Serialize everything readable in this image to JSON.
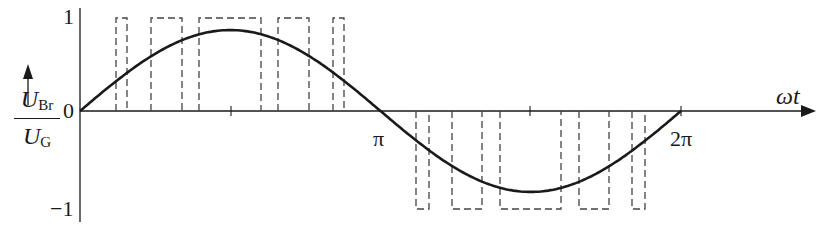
{
  "chart_data": {
    "type": "line",
    "title": "",
    "xlabel": "ωt",
    "ylabel": "U_Br / U_G",
    "ylabel_parts": {
      "num_main": "U",
      "num_sub": "Br",
      "den_main": "U",
      "den_sub": "G"
    },
    "xtick_labels": [
      "π",
      "2π"
    ],
    "ytick_labels": [
      "1",
      "0",
      "−1"
    ],
    "ylim": [
      -1,
      1
    ],
    "xlim": [
      0,
      6.2832
    ],
    "grid": false,
    "legend": null,
    "series": [
      {
        "name": "fundamental (sine)",
        "style": "solid",
        "amplitude": 0.87,
        "description": "0.87·sin(ωt) over one period 0..2π"
      },
      {
        "name": "PWM pulses",
        "style": "dashed",
        "description": "Rectangular pulses of height +1 in first half-period and −1 in second half-period",
        "positive_pulses_rad": [
          [
            0.22,
            0.45
          ],
          [
            0.73,
            1.38
          ],
          [
            1.72,
            3.02
          ],
          [
            4.04,
            4.67
          ],
          [
            5.15,
            5.38
          ]
        ],
        "positive_pulses_px": [
          [
            116,
            127
          ],
          [
            151,
            182
          ],
          [
            199,
            261
          ],
          [
            278,
            309
          ],
          [
            333,
            344
          ]
        ],
        "negative_pulses_px": [
          [
            416,
            429
          ],
          [
            452,
            482
          ],
          [
            500,
            561
          ],
          [
            579,
            609
          ],
          [
            632,
            645
          ]
        ]
      }
    ]
  },
  "labels": {
    "y_one": "1",
    "y_zero": "0",
    "y_minus_one": "−1",
    "x_pi": "π",
    "x_two_pi": "2π",
    "x_axis": "ωt",
    "frac_num": "U",
    "frac_num_sub": "Br",
    "frac_den": "U",
    "frac_den_sub": "G"
  },
  "colors": {
    "ink": "#1a1a1a",
    "dash": "#444444",
    "background": "#ffffff"
  }
}
